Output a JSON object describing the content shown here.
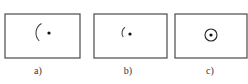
{
  "figure": {
    "stroke_color": "#4a4a4a",
    "dot_color": "#111111",
    "panels": [
      {
        "id": "a",
        "label": "a)",
        "frame": {
          "x": 5,
          "y": 14,
          "w": 75,
          "h": 44
        },
        "arc": {
          "cx": 47,
          "cy": 33,
          "r": 11,
          "start_deg": 120,
          "end_deg": 225
        },
        "dot": {
          "cx": 49,
          "cy": 33,
          "r": 1.6
        },
        "label_pos": {
          "x": 38,
          "y": 66
        }
      },
      {
        "id": "b",
        "label": "b)",
        "frame": {
          "x": 94,
          "y": 14,
          "w": 73,
          "h": 44
        },
        "arc": {
          "cx": 129,
          "cy": 33,
          "r": 7,
          "start_deg": 125,
          "end_deg": 215
        },
        "dot": {
          "cx": 130,
          "cy": 34,
          "r": 1.6
        },
        "label_pos": {
          "x": 128,
          "y": 66
        }
      },
      {
        "id": "c",
        "label": "c)",
        "frame": {
          "x": 175,
          "y": 14,
          "w": 72,
          "h": 44
        },
        "circle": {
          "cx": 211,
          "cy": 35,
          "r": 6
        },
        "dot": {
          "cx": 211,
          "cy": 35,
          "r": 1.6
        },
        "label_pos": {
          "x": 210,
          "y": 66
        }
      }
    ]
  }
}
